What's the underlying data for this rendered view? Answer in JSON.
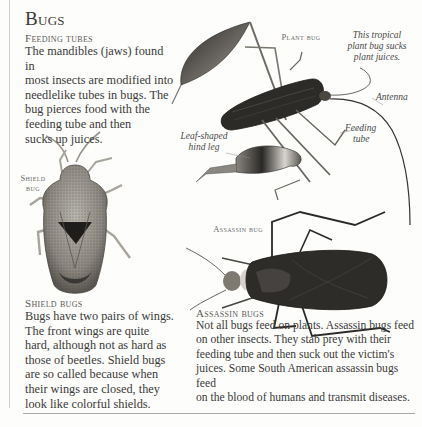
{
  "page": {
    "title": "Bugs"
  },
  "sections": {
    "feeding_tubes": {
      "heading": "Feeding tubes",
      "text": "The mandibles (jaws) found in\nmost insects are modified into\nneedlelike tubes in bugs. The\nbug pierces food with the\nfeeding tube and then\nsucks up juices."
    },
    "shield_bugs": {
      "heading": "Shield bugs",
      "text": "Bugs have two pairs of wings.\nThe front wings are quite\nhard, although not as hard as\nthose of beetles. Shield bugs\nare so called because when\ntheir wings are closed, they\nlook like colorful shields."
    },
    "assassin_bugs": {
      "heading": "Assassin bugs",
      "text": "Not all bugs feed on plants. Assassin bugs feed\non other insects. They stab prey with their\nfeeding tube and then suck out the victim's\njuices. Some South American assassin bugs feed\non the blood of humans and transmit diseases."
    }
  },
  "figures": {
    "plant_bug": {
      "label": "Plant bug",
      "caption": "This tropical plant bug sucks plant juices.",
      "caption_lines": [
        "This tropical",
        "plant bug sucks",
        "plant juices."
      ],
      "annotations": {
        "antenna": "Antenna",
        "feeding_tube_lines": [
          "Feeding",
          "tube"
        ],
        "hind_leg_lines": [
          "Leaf-shaped",
          "hind leg"
        ]
      }
    },
    "shield_bug": {
      "label_lines": [
        "Shield",
        "bug"
      ]
    },
    "assassin_bug": {
      "label": "Assassin bug"
    }
  },
  "colors": {
    "background": "#fdfdfc",
    "text": "#3a3a38",
    "label_gray": "#6b6b68",
    "rule": "#a9a9a6",
    "bug_dark": "#2b2a28"
  }
}
